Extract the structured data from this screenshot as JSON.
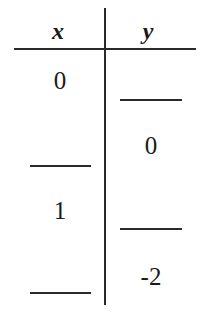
{
  "table": {
    "headers": [
      "x",
      "y"
    ],
    "rows": [
      {
        "x": "0",
        "y": ""
      },
      {
        "x": "",
        "y": "0"
      },
      {
        "x": "1",
        "y": ""
      },
      {
        "x": "",
        "y": "-2"
      }
    ],
    "blank_placeholder": "____"
  }
}
